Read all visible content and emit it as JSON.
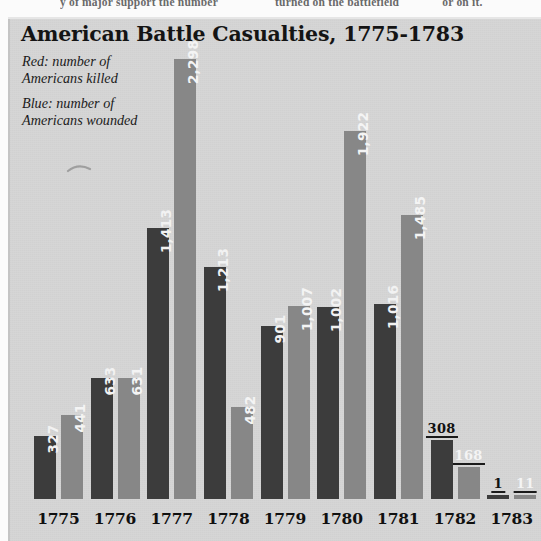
{
  "page_bleed": {
    "fragments": [
      "y of major support the number",
      "turned on the battlefield",
      "or on it."
    ]
  },
  "chart_data": {
    "type": "bar",
    "title": "American Battle Casualties, 1775-1783",
    "xlabel": "",
    "ylabel": "",
    "ylim": [
      0,
      2400
    ],
    "grid": false,
    "legend_position": "top-left",
    "categories": [
      "1775",
      "1776",
      "1777",
      "1778",
      "1779",
      "1780",
      "1781",
      "1782",
      "1783"
    ],
    "series": [
      {
        "name": "Red: number of Americans killed",
        "color": "#3c3c3c",
        "key": "killed",
        "values": [
          327,
          633,
          1413,
          1213,
          901,
          1002,
          1016,
          308,
          1
        ],
        "labels": [
          "327",
          "633",
          "1,413",
          "1,213",
          "901",
          "1,002",
          "1,016",
          "308",
          "1"
        ]
      },
      {
        "name": "Blue: number of Americans wounded",
        "color": "#878787",
        "key": "wounded",
        "values": [
          441,
          631,
          2298,
          482,
          1007,
          1922,
          1485,
          168,
          11
        ],
        "labels": [
          "441",
          "631",
          "2,298",
          "482",
          "1,007",
          "1,922",
          "1,485",
          "168",
          "11"
        ]
      }
    ],
    "legend": [
      {
        "line1": "Red: number of",
        "line2": "Americans killed"
      },
      {
        "line1": "Blue: number of",
        "line2": "Americans wounded"
      }
    ]
  }
}
